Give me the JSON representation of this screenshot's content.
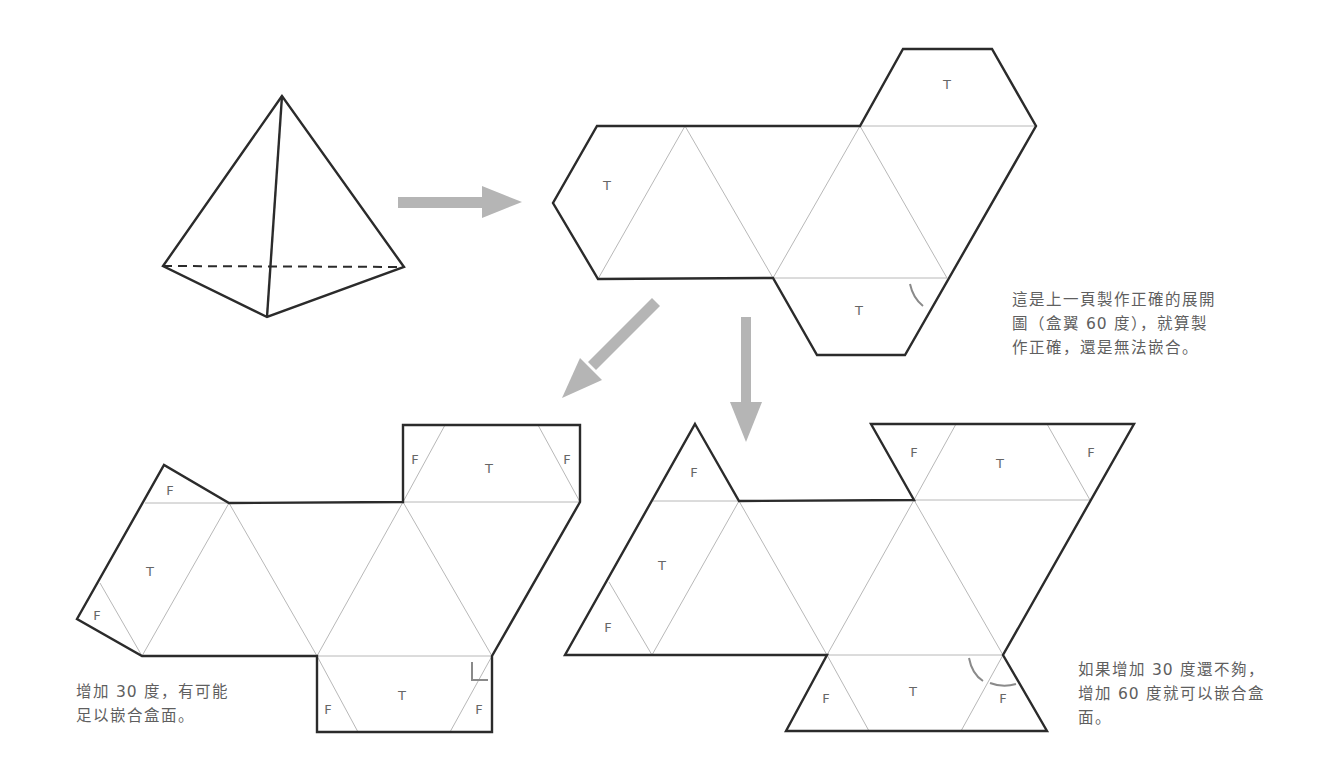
{
  "captions": {
    "top_right": {
      "lines": [
        "這是上一頁製作正確的展開",
        "圖（盒翼 60 度），就算製",
        "作正確，還是無法嵌合。"
      ]
    },
    "bottom_left": {
      "lines": [
        "增加 30 度，有可能",
        "足以嵌合盒面。"
      ]
    },
    "bottom_right": {
      "lines": [
        "如果增加 30 度還不夠，",
        "增加 60 度就可以嵌合盒",
        "面。"
      ]
    }
  },
  "labels": {
    "tab": "T",
    "flap": "F"
  },
  "nets": {
    "original_60deg": {
      "tab_labels": [
        "T",
        "T",
        "T"
      ]
    },
    "plus_30deg": {
      "tab_labels": [
        "T",
        "T",
        "T"
      ],
      "flap_labels": [
        "F",
        "F",
        "F",
        "F",
        "F",
        "F"
      ]
    },
    "plus_60deg": {
      "tab_labels": [
        "T",
        "T",
        "T"
      ],
      "flap_labels": [
        "F",
        "F",
        "F",
        "F",
        "F",
        "F"
      ]
    }
  },
  "colors": {
    "outline": "#2b2b2b",
    "fold_line": "#b8b8b8",
    "arrow": "#b5b5b5",
    "text": "#5f5f5f"
  }
}
